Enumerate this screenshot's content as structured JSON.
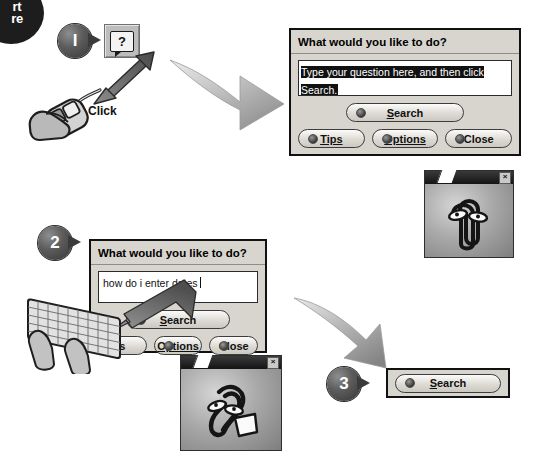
{
  "corner_badge": {
    "line1": "rt",
    "line2": "re",
    "note": "partially cropped dark circular badge"
  },
  "step1": {
    "number": "I",
    "help_button": {
      "icon": "help-question-bubble-icon",
      "glyph": "?"
    },
    "pointer_label": "Click",
    "mouse_icon": "hand-on-mouse-icon",
    "arrow_icon": "curved-arrow-right-icon"
  },
  "dialog1": {
    "title": "What would you like to do?",
    "question_field": {
      "value": "Type your question here, and then click Search.",
      "selected": true
    },
    "search_label": "Search",
    "search_accel": "S",
    "buttons": [
      {
        "label": "Tips",
        "accel": "T"
      },
      {
        "label": "Options",
        "accel": "O"
      },
      {
        "label": "Close",
        "accel": ""
      }
    ]
  },
  "assistant1": {
    "icon": "paperclip-assistant-icon",
    "close_label": "×"
  },
  "step2": {
    "number": "2",
    "keyboard_icon": "hands-on-keyboard-icon",
    "arrow_icon": "arrow-up-left-to-field-icon"
  },
  "dialog2": {
    "title": "What would you like to do?",
    "question_field": {
      "value": "how do i enter dates",
      "selected": false
    },
    "search_label": "Search",
    "search_accel": "S",
    "buttons": [
      {
        "label": "s",
        "accel": ""
      },
      {
        "label": "Options",
        "accel": "O"
      },
      {
        "label": "Close",
        "accel": ""
      }
    ]
  },
  "assistant2": {
    "icon": "paperclip-assistant-writing-icon",
    "close_label": "×"
  },
  "arrow2": {
    "icon": "curved-arrow-down-right-icon"
  },
  "step3": {
    "number": "3",
    "search_label": "Search",
    "search_accel": "S"
  },
  "colors": {
    "dialog_face": "#d8d5ce",
    "dialog_border": "#111111",
    "selection": "#111111",
    "assistant_bar": "#1a1a1a",
    "badge": "#3b3b3b"
  }
}
